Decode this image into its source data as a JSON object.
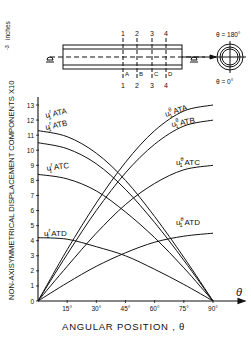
{
  "chart_data": {
    "type": "line",
    "title": "",
    "xlabel": "ANGULAR POSITION , θ",
    "ylabel": "NON-AXISYMMETRICAL DISPLACEMENT COMPONENTS X10^-3 inches",
    "ylabel_main": "NON-AXISYMMETRICAL DISPLACEMENT COMPONENTS X10",
    "ylabel_exp": "-3",
    "ylabel_unit": "inches",
    "x_axis_symbol": "θ",
    "x_ticks": [
      "15°",
      "30°",
      "45°",
      "60°",
      "75°",
      "90°"
    ],
    "x_tick_values": [
      15,
      30,
      45,
      60,
      75,
      90
    ],
    "y_ticks": [
      "0",
      "1",
      "2",
      "3",
      "4",
      "5",
      "6",
      "7",
      "8",
      "9",
      "10",
      "11",
      "12",
      "13"
    ],
    "xlim": [
      0,
      90
    ],
    "ylim": [
      0,
      13
    ],
    "grid": false,
    "x": [
      0,
      15,
      30,
      45,
      60,
      75,
      90
    ],
    "series": [
      {
        "name": "u1r ATA",
        "label_main": "u",
        "label_sup": "r",
        "label_sub": "1",
        "label_pos": "ATA",
        "values": [
          11.3,
          10.9,
          9.8,
          8.0,
          5.6,
          2.9,
          0
        ]
      },
      {
        "name": "u1r ATB",
        "label_main": "u",
        "label_sup": "r",
        "label_sub": "1",
        "label_pos": "ATB",
        "values": [
          10.5,
          10.1,
          9.1,
          7.4,
          5.2,
          2.7,
          0
        ]
      },
      {
        "name": "u1r ATC",
        "label_main": "u",
        "label_sup": "r",
        "label_sub": "1",
        "label_pos": "ATC",
        "values": [
          8.4,
          8.1,
          7.3,
          5.9,
          4.2,
          2.2,
          0
        ]
      },
      {
        "name": "u1r ATD",
        "label_main": "u",
        "label_sup": "r",
        "label_sub": "1",
        "label_pos": "ATD",
        "values": [
          4.2,
          4.1,
          3.6,
          3.0,
          2.1,
          1.1,
          0
        ]
      },
      {
        "name": "u1θ ATA",
        "label_main": "u",
        "label_sup": "θ",
        "label_sub": "1",
        "label_pos": "ATA",
        "values": [
          0,
          3.4,
          6.5,
          9.2,
          11.3,
          12.6,
          13.0
        ]
      },
      {
        "name": "u1θ ATB",
        "label_main": "u",
        "label_sup": "θ",
        "label_sub": "1",
        "label_pos": "ATB",
        "values": [
          0,
          3.1,
          6.0,
          8.5,
          10.4,
          11.6,
          12.0
        ]
      },
      {
        "name": "u1θ ATC",
        "label_main": "u",
        "label_sup": "θ",
        "label_sub": "1",
        "label_pos": "ATC",
        "values": [
          0,
          2.3,
          4.5,
          6.4,
          7.8,
          8.7,
          9.0
        ]
      },
      {
        "name": "u1θ ATD",
        "label_main": "u",
        "label_sup": "θ",
        "label_sub": "1",
        "label_pos": "ATD",
        "values": [
          0,
          1.2,
          2.3,
          3.2,
          3.9,
          4.3,
          4.5
        ]
      }
    ],
    "legend": "inline labels on curves"
  },
  "inset": {
    "section_numbers_top": [
      "1",
      "2",
      "3",
      "4"
    ],
    "section_numbers_bottom": [
      "1",
      "2",
      "3",
      "4"
    ],
    "section_letters": [
      "A",
      "B",
      "C",
      "D"
    ],
    "theta_top": "θ = 180°",
    "theta_bottom": "θ = 0°"
  }
}
